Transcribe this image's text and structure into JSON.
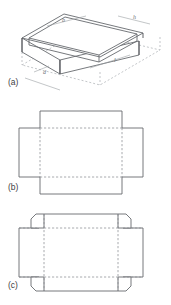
{
  "figure": {
    "panels": [
      {
        "id": "a",
        "label": "(a)",
        "caption": "Isometric open-top tray",
        "type": "isometric-tray",
        "dimension_labels": [
          {
            "name": "width-label",
            "text": "b"
          },
          {
            "name": "height-label",
            "text": "h"
          },
          {
            "name": "length-label",
            "text": "l"
          },
          {
            "name": "depth-label",
            "text": "d"
          }
        ]
      },
      {
        "id": "b",
        "label": "(b)",
        "caption": "Plain cross-shaped net",
        "type": "net-plain"
      },
      {
        "id": "c",
        "label": "(c)",
        "caption": "Net with corner glue tabs",
        "type": "net-tabbed"
      }
    ]
  },
  "colors": {
    "stroke_solid": "#666a6e",
    "stroke_dashed": "#8b8f93",
    "stroke_light": "#a9adb1",
    "label_text": "#3d4044",
    "background": "#ffffff"
  }
}
